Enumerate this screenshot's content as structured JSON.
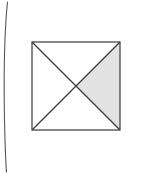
{
  "page": {
    "width": 143,
    "height": 181,
    "background_color": "#ffffff",
    "scan_artifact": {
      "name": "page-edge-line",
      "description": "thin curved vertical scan edge near left margin",
      "color": "#555555",
      "stroke_width": 1.1,
      "path": "M 7.5 2 C 4.6 30, 4.0 62, 4.2 96 C 4.4 128, 5.2 152, 6.4 172"
    }
  },
  "figure": {
    "name": "square-with-diagonals",
    "type": "geometric-diagram",
    "square": {
      "x": 32,
      "y": 42,
      "width": 88,
      "height": 88,
      "stroke_color": "#3a3a3a",
      "stroke_width": 1.2,
      "fill_color": "#ffffff"
    },
    "center_point": {
      "x": 76,
      "y": 86
    },
    "vertices": {
      "top_left": {
        "x": 32,
        "y": 42
      },
      "top_right": {
        "x": 120,
        "y": 42
      },
      "bottom_right": {
        "x": 120,
        "y": 130
      },
      "bottom_left": {
        "x": 32,
        "y": 130
      }
    },
    "diagonals": [
      {
        "name": "diagonal-tl-br",
        "from": "top_left",
        "to": "bottom_right",
        "color": "#3a3a3a",
        "stroke_width": 1.2
      },
      {
        "name": "diagonal-tr-bl",
        "from": "top_right",
        "to": "bottom_left",
        "color": "#3a3a3a",
        "stroke_width": 1.2
      }
    ],
    "triangles": [
      {
        "name": "triangle-top",
        "points": "32,42 120,42 76,86",
        "fill": "#ffffff",
        "shaded": false
      },
      {
        "name": "triangle-left",
        "points": "32,42 76,86 32,130",
        "fill": "#ffffff",
        "shaded": false
      },
      {
        "name": "triangle-bottom",
        "points": "32,130 76,86 120,130",
        "fill": "#ffffff",
        "shaded": false
      },
      {
        "name": "triangle-right-shaded",
        "points": "120,42 120,130 76,86",
        "fill": "#e2e2e2",
        "shaded": true
      }
    ],
    "shaded_region": {
      "name": "right-triangle",
      "fill_color": "#e2e2e2",
      "fraction_of_square": "1/4"
    }
  },
  "chart_data": {
    "type": "diagram",
    "title": "",
    "shape": "square",
    "subdivision": "two diagonals forming four congruent triangles",
    "regions": [
      "top",
      "right",
      "bottom",
      "left"
    ],
    "shaded_regions": [
      "right"
    ],
    "shaded_fraction": 0.25,
    "labels": [],
    "annotations": []
  }
}
